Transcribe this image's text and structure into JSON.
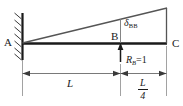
{
  "figure": {
    "type": "structural-beam-diagram",
    "width": 183,
    "height": 106,
    "background_color": "#ffffff",
    "line_color": "#1a1a1a",
    "dimension_color": "#555555"
  },
  "labels": {
    "point_a": "A",
    "point_b": "B",
    "point_c": "C",
    "deflection_symbol": "δ",
    "deflection_subscript": "BB",
    "force_symbol": "R",
    "force_subscript": "B",
    "force_value": "=1",
    "dimension_left": "L",
    "dimension_right_numerator": "L",
    "dimension_right_denominator": "4"
  },
  "geometry": {
    "wall_x": 22,
    "beam_y": 43,
    "beam_right_x": 167,
    "point_b_x": 120,
    "deflected_tip_y": 8,
    "dimension_line_y": 73,
    "support_hatch_count": 7
  }
}
